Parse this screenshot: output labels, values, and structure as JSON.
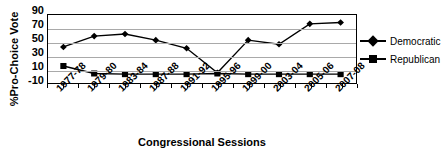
{
  "chart_data": {
    "type": "line",
    "title": "",
    "xlabel": "Congressional Sessions",
    "ylabel": "%Pro-Choice Vote",
    "categories": [
      "1977-78",
      "1979-80",
      "1983-84",
      "1987-88",
      "1991-92",
      "1995-96",
      "1999-00",
      "2003-04",
      "2005-06",
      "2007-08"
    ],
    "yticks": [
      90,
      70,
      50,
      30,
      10,
      -10
    ],
    "ylim": [
      -10,
      90
    ],
    "grid": true,
    "legend_position": "right",
    "series": [
      {
        "name": "Democratic",
        "marker": "diamond",
        "color": "#000000",
        "values": [
          43,
          59,
          62,
          53,
          41,
          5,
          53,
          47,
          77,
          79
        ]
      },
      {
        "name": "Republican",
        "marker": "square",
        "color": "#000000",
        "values": [
          15,
          4,
          3,
          3,
          3,
          4,
          3,
          3,
          3,
          3
        ]
      }
    ]
  },
  "legend": {
    "items": [
      {
        "label": "Democratic"
      },
      {
        "label": "Republican"
      }
    ]
  }
}
